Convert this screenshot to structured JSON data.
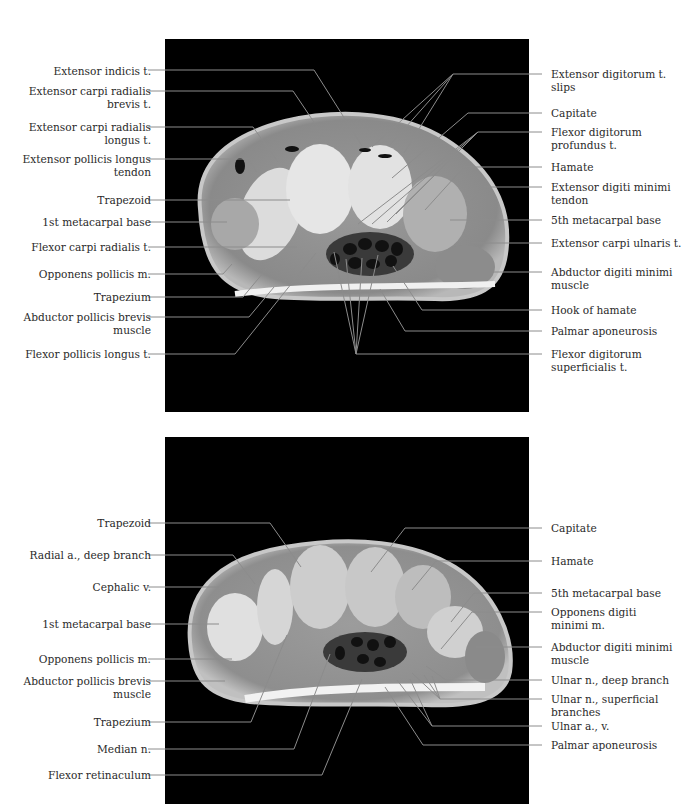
{
  "figure": {
    "line_color": "#8c8c8c",
    "panels": [
      {
        "id": "top",
        "left_labels": [
          {
            "text": "Extensor indicis t.",
            "y": 72
          },
          {
            "text": "Extensor carpi radialis\nbrevis t.",
            "y": 91
          },
          {
            "text": "Extensor carpi radialis\nlongus t.",
            "y": 127
          },
          {
            "text": "Extensor pollicis longus\ntendon",
            "y": 159
          },
          {
            "text": "Trapezoid",
            "y": 200
          },
          {
            "text": "1st metacarpal base",
            "y": 222
          },
          {
            "text": "Flexor carpi radialis t.",
            "y": 247
          },
          {
            "text": "Opponens pollicis m.",
            "y": 274
          },
          {
            "text": "Trapezium",
            "y": 297
          },
          {
            "text": "Abductor pollicis brevis\nmuscle",
            "y": 317
          },
          {
            "text": "Flexor pollicis longus t.",
            "y": 354
          }
        ],
        "right_labels": [
          {
            "text": "Extensor digitorum t.\nslips",
            "y": 74
          },
          {
            "text": "Capitate",
            "y": 113
          },
          {
            "text": "Flexor digitorum\nprofundus t.",
            "y": 132
          },
          {
            "text": "Hamate",
            "y": 167
          },
          {
            "text": "Extensor digiti minimi\ntendon",
            "y": 187
          },
          {
            "text": "5th metacarpal base",
            "y": 220
          },
          {
            "text": "Extensor carpi ulnaris t.",
            "y": 243
          },
          {
            "text": "Abductor digiti minimi\nmuscle",
            "y": 272
          },
          {
            "text": "Hook of hamate",
            "y": 310
          },
          {
            "text": "Palmar aponeurosis",
            "y": 331
          },
          {
            "text": "Flexor digitorum\nsuperficialis t.",
            "y": 354
          }
        ]
      },
      {
        "id": "bottom",
        "left_labels": [
          {
            "text": "Trapezoid",
            "y": 525
          },
          {
            "text": "Radial a., deep branch",
            "y": 557
          },
          {
            "text": "Cephalic v.",
            "y": 589
          },
          {
            "text": "1st metacarpal base",
            "y": 625
          },
          {
            "text": "Opponens pollicis m.",
            "y": 660
          },
          {
            "text": "Abductor pollicis brevis\nmuscle",
            "y": 681
          },
          {
            "text": "Trapezium",
            "y": 722
          },
          {
            "text": "Median n.",
            "y": 749
          },
          {
            "text": "Flexor retinaculum",
            "y": 775
          }
        ],
        "right_labels": [
          {
            "text": "Capitate",
            "y": 530
          },
          {
            "text": "Hamate",
            "y": 562
          },
          {
            "text": "5th metacarpal base",
            "y": 594
          },
          {
            "text": "Opponens digiti\nminimi m.",
            "y": 613
          },
          {
            "text": "Abductor digiti minimi\nmuscle",
            "y": 648
          },
          {
            "text": "Ulnar n., deep branch",
            "y": 681
          },
          {
            "text": "Ulnar n., superficial\nbranches",
            "y": 700
          },
          {
            "text": "Ulnar a., v.",
            "y": 727
          },
          {
            "text": "Palmar aponeurosis",
            "y": 746
          }
        ]
      }
    ]
  }
}
